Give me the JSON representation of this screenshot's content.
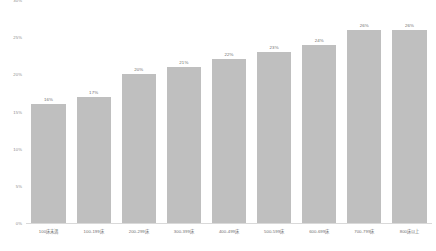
{
  "chart_data": {
    "type": "bar",
    "title": "",
    "subtitle": "",
    "xlabel": "",
    "ylabel": "",
    "ylim": [
      0,
      30
    ],
    "grid": false,
    "legend": null,
    "orientation": "vertical",
    "bar_color": "#bfbfbf",
    "categories": [
      "100床未満",
      "100-199床",
      "200-299床",
      "300-399床",
      "400-499床",
      "500-599床",
      "600-699床",
      "700-799床",
      "800床以上"
    ],
    "values": [
      16,
      17,
      20,
      21,
      22,
      23,
      24,
      26,
      26
    ],
    "data_labels": [
      "16%",
      "17%",
      "20%",
      "21%",
      "22%",
      "23%",
      "24%",
      "26%",
      "26%"
    ],
    "y_ticks": [
      0,
      5,
      10,
      15,
      20,
      25,
      30
    ],
    "y_tick_labels": [
      "0%",
      "5%",
      "10%",
      "15%",
      "20%",
      "25%",
      "30%"
    ]
  }
}
